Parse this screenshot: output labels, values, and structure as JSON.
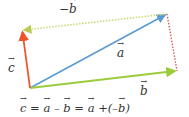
{
  "diagram": {
    "vectors": [
      {
        "name": "a",
        "label": "a",
        "color": "#5b9bd5",
        "style": "solid",
        "from": [
          30,
          88
        ],
        "to": [
          167,
          14
        ]
      },
      {
        "name": "b",
        "label": "b",
        "color": "#9ccc3c",
        "style": "solid",
        "from": [
          30,
          88
        ],
        "to": [
          177,
          71
        ]
      },
      {
        "name": "c",
        "label": "c",
        "color": "#f0552a",
        "style": "solid",
        "from": [
          30,
          88
        ],
        "to": [
          22,
          30
        ]
      },
      {
        "name": "neg_b",
        "label": "−b",
        "color": "#c8d870",
        "style": "dotted",
        "from": [
          167,
          14
        ],
        "to": [
          22,
          30
        ]
      },
      {
        "name": "b_shifted",
        "label": "",
        "color": "#e05050",
        "style": "dotted",
        "from": [
          167,
          14
        ],
        "to": [
          177,
          71
        ]
      }
    ],
    "labels": {
      "a": "a",
      "b": "b",
      "c": "c",
      "neg_b_minus": "−",
      "neg_b": "b"
    },
    "formula": {
      "c": "c",
      "eq1": " = ",
      "a1": "a",
      "minus": " – ",
      "b1": "b",
      "eq2": " = ",
      "a2": "a",
      "plus": " +(–",
      "b2": "b",
      "close": ")"
    }
  }
}
